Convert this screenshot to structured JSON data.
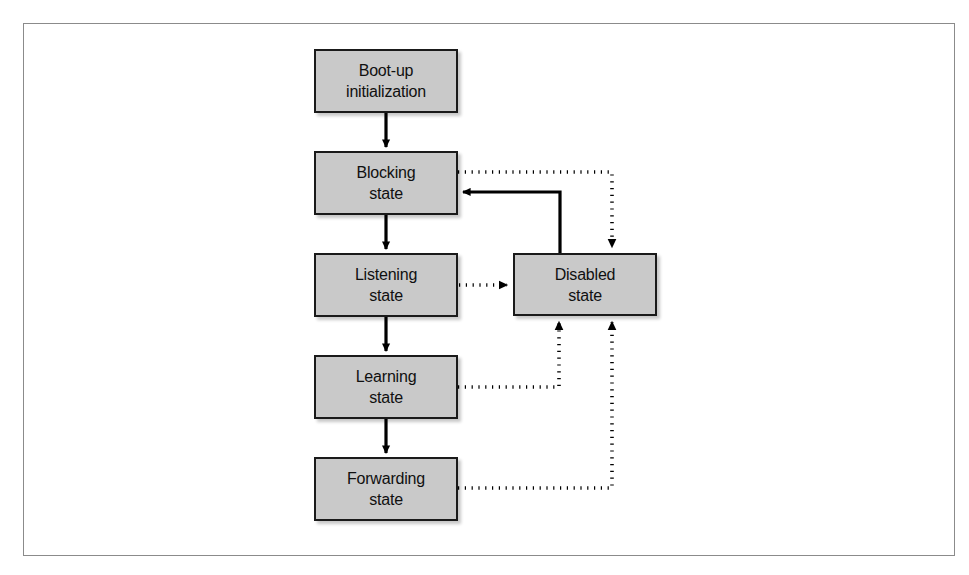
{
  "figure": {
    "type": "state-transition-diagram",
    "frame": {
      "border_color": "#8b8b8b",
      "background": "#ffffff"
    },
    "style": {
      "node_fill": "#c9c9c9",
      "node_border": "#1a1a1a",
      "text_color": "#101010",
      "solid_edge_color": "#000000",
      "dotted_edge_color": "#000000"
    }
  },
  "nodes": [
    {
      "id": "boot-up-initialization",
      "line1": "Boot-up",
      "line2": "initialization",
      "x": 314,
      "y": 49,
      "w": 144,
      "h": 64
    },
    {
      "id": "blocking-state",
      "line1": "Blocking",
      "line2": "state",
      "x": 314,
      "y": 151,
      "w": 144,
      "h": 64
    },
    {
      "id": "listening-state",
      "line1": "Listening",
      "line2": "state",
      "x": 314,
      "y": 253,
      "w": 144,
      "h": 64
    },
    {
      "id": "learning-state",
      "line1": "Learning",
      "line2": "state",
      "x": 314,
      "y": 355,
      "w": 144,
      "h": 64
    },
    {
      "id": "forwarding-state",
      "line1": "Forwarding",
      "line2": "state",
      "x": 314,
      "y": 457,
      "w": 144,
      "h": 64
    },
    {
      "id": "disabled-state",
      "line1": "Disabled",
      "line2": "state",
      "x": 513,
      "y": 253,
      "w": 144,
      "h": 63
    }
  ],
  "edges": [
    {
      "id": "boot-to-blocking",
      "from": "boot-up-initialization",
      "to": "blocking-state",
      "style": "solid",
      "arrow": true
    },
    {
      "id": "blocking-to-listening",
      "from": "blocking-state",
      "to": "listening-state",
      "style": "solid",
      "arrow": true
    },
    {
      "id": "listening-to-learning",
      "from": "listening-state",
      "to": "learning-state",
      "style": "solid",
      "arrow": true
    },
    {
      "id": "learning-to-forwarding",
      "from": "learning-state",
      "to": "forwarding-state",
      "style": "solid",
      "arrow": true
    },
    {
      "id": "blocking-to-disabled",
      "from": "blocking-state",
      "to": "disabled-state",
      "style": "dotted",
      "arrow": true
    },
    {
      "id": "listening-to-disabled",
      "from": "listening-state",
      "to": "disabled-state",
      "style": "dotted",
      "arrow": true
    },
    {
      "id": "learning-to-disabled",
      "from": "learning-state",
      "to": "disabled-state",
      "style": "dotted",
      "arrow": true
    },
    {
      "id": "forwarding-to-disabled",
      "from": "forwarding-state",
      "to": "disabled-state",
      "style": "dotted",
      "arrow": true
    },
    {
      "id": "disabled-to-blocking",
      "from": "disabled-state",
      "to": "blocking-state",
      "style": "solid",
      "arrow": true
    }
  ]
}
